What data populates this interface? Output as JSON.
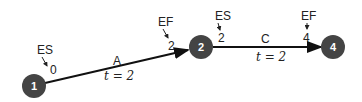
{
  "diagram": {
    "type": "activity-on-arrow network",
    "nodes": [
      {
        "id": "1",
        "label": "1"
      },
      {
        "id": "2",
        "label": "2"
      },
      {
        "id": "4",
        "label": "4"
      }
    ],
    "edges": [
      {
        "from": "1",
        "to": "2",
        "activity": "A",
        "duration": "t = 2",
        "es_label": "ES",
        "es_value": "0",
        "ef_label": "EF",
        "ef_value": "2"
      },
      {
        "from": "2",
        "to": "4",
        "activity": "C",
        "duration": "t = 2",
        "es_label": "ES",
        "es_value": "2",
        "ef_label": "EF",
        "ef_value": "4"
      }
    ],
    "colors": {
      "node": "#444444",
      "line": "#111111"
    }
  }
}
